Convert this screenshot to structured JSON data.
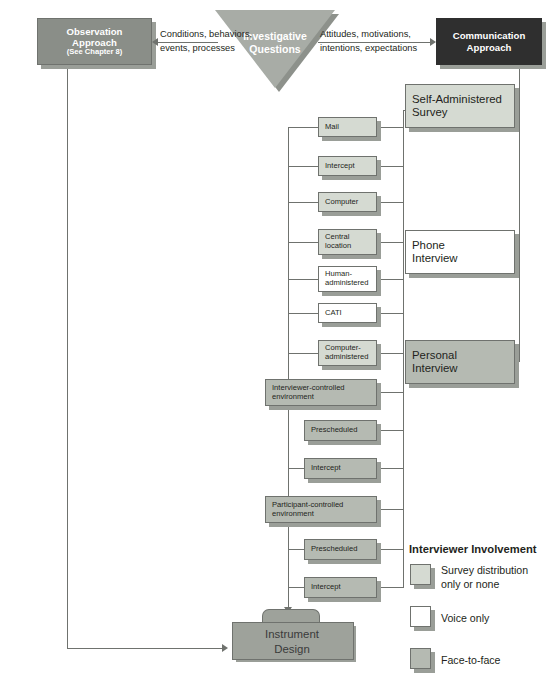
{
  "diagram": {
    "nodes": {
      "observation": {
        "line1": "Observation",
        "line2": "Approach",
        "line3": "(See Chapter 8)",
        "fill": "#8a8e88"
      },
      "investigative": {
        "line1": "Investigative",
        "line2": "Questions",
        "fill": "#a8aca6"
      },
      "communication": {
        "line1": "Communication",
        "line2": "Approach",
        "fill": "#2f2f2f"
      },
      "instrument": {
        "line1": "Instrument",
        "line2": "Design",
        "fill": "#9ea29b"
      }
    },
    "edge_labels": {
      "left": "Conditions, behaviors,\nevents, processes",
      "left_line1": "Conditions, behaviors,",
      "left_line2": "events, processes",
      "right_line1": "Attitudes, motivations,",
      "right_line2": "intentions, expectations"
    },
    "methods": [
      {
        "label": "Mail",
        "fill": "light"
      },
      {
        "label": "Intercept",
        "fill": "light"
      },
      {
        "label": "Computer",
        "fill": "light"
      },
      {
        "label": "Central location",
        "fill": "light"
      },
      {
        "label": "Human-administered",
        "fill": "white"
      },
      {
        "label": "CATI",
        "fill": "white"
      },
      {
        "label": "Computer-administered",
        "fill": "light"
      },
      {
        "label": "Interviewer-controlled environment",
        "fill": "mid"
      },
      {
        "label": "Prescheduled",
        "fill": "mid"
      },
      {
        "label": "Intercept",
        "fill": "mid"
      },
      {
        "label": "Participant-controlled environment",
        "fill": "mid"
      },
      {
        "label": "Prescheduled",
        "fill": "mid"
      },
      {
        "label": "Intercept",
        "fill": "mid"
      }
    ],
    "categories": [
      {
        "line1": "Self-Administered",
        "line2": "Survey",
        "fill": "light"
      },
      {
        "line1": "Phone",
        "line2": "Interview",
        "fill": "white"
      },
      {
        "line1": "Personal",
        "line2": "Interview",
        "fill": "mid"
      }
    ],
    "legend": {
      "title": "Interviewer Involvement",
      "items": [
        {
          "line1": "Survey distribution",
          "line2": "only or none",
          "fill": "light"
        },
        {
          "line1": "Voice only",
          "line2": "",
          "fill": "white"
        },
        {
          "line1": "Face-to-face",
          "line2": "",
          "fill": "mid"
        }
      ]
    },
    "colors": {
      "light": "#d5dad2",
      "white": "#ffffff",
      "mid": "#b5bab2",
      "dark": "#2f2f2f",
      "line": "#6f726e"
    }
  }
}
